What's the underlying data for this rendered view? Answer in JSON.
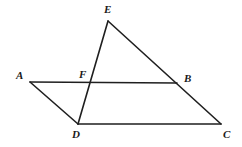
{
  "figure": {
    "canvas": {
      "width": 242,
      "height": 147,
      "background": "#ffffff"
    },
    "stroke_color": "#1f1f1f",
    "label_color": "#1a1a1a",
    "points": {
      "A": {
        "label": "A",
        "x": 30,
        "y": 82,
        "label_x": 16,
        "label_y": 70
      },
      "B": {
        "label": "B",
        "x": 177,
        "y": 83,
        "label_x": 184,
        "label_y": 73
      },
      "C": {
        "label": "C",
        "x": 221,
        "y": 124,
        "label_x": 223,
        "label_y": 129
      },
      "D": {
        "label": "D",
        "x": 78,
        "y": 124,
        "label_x": 72,
        "label_y": 129
      },
      "E": {
        "label": "E",
        "x": 108,
        "y": 21,
        "label_x": 104,
        "label_y": 4
      },
      "F": {
        "label": "F",
        "x": 91,
        "y": 83,
        "label_x": 79,
        "label_y": 69
      }
    },
    "segments": [
      {
        "name": "segment-AB",
        "from": "A",
        "to": "B"
      },
      {
        "name": "segment-AD",
        "from": "A",
        "to": "D"
      },
      {
        "name": "segment-DC",
        "from": "D",
        "to": "C"
      },
      {
        "name": "segment-EC",
        "from": "E",
        "to": "C"
      },
      {
        "name": "segment-ED",
        "from": "E",
        "to": "D"
      }
    ]
  }
}
